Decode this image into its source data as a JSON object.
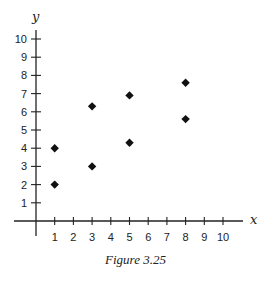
{
  "chart_data": {
    "type": "scatter",
    "title": "",
    "caption": "Figure 3.25",
    "xlabel": "x",
    "ylabel": "y",
    "xlim": [
      0,
      10
    ],
    "ylim": [
      0,
      10
    ],
    "grid": false,
    "legend": null,
    "x_ticks": [
      1,
      2,
      3,
      4,
      5,
      6,
      7,
      8,
      9,
      10
    ],
    "y_ticks": [
      1,
      2,
      3,
      4,
      5,
      6,
      7,
      8,
      9,
      10
    ],
    "marker": "diamond",
    "marker_color": "#111111",
    "series": [
      {
        "name": "points",
        "points": [
          {
            "x": 1,
            "y": 4
          },
          {
            "x": 1,
            "y": 2
          },
          {
            "x": 3,
            "y": 6.3
          },
          {
            "x": 3,
            "y": 3
          },
          {
            "x": 5,
            "y": 6.9
          },
          {
            "x": 5,
            "y": 4.3
          },
          {
            "x": 8,
            "y": 7.6
          },
          {
            "x": 8,
            "y": 5.6
          }
        ]
      }
    ]
  }
}
